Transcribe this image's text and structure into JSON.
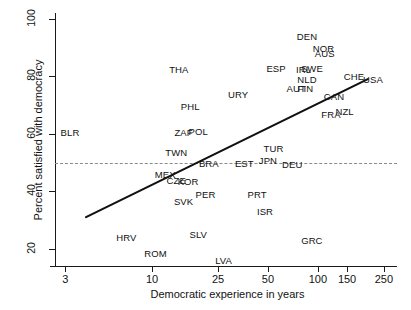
{
  "chart_data": {
    "type": "scatter",
    "title": "",
    "xlabel": "Democratic experience in years",
    "ylabel": "Percent satisfied with democracy",
    "xscale": "log",
    "xlim": [
      2.6,
      300
    ],
    "ylim": [
      14,
      102
    ],
    "xticks": [
      3,
      10,
      25,
      50,
      100,
      150,
      250
    ],
    "xticklabels": [
      "3",
      "10",
      "25",
      "50",
      "100",
      "150",
      "250"
    ],
    "yticks": [
      20,
      40,
      60,
      80,
      100
    ],
    "yticklabels": [
      "20",
      "40",
      "60",
      "80",
      "100"
    ],
    "grid": false,
    "legend": null,
    "reference_line": {
      "y": 50,
      "style": "dashed",
      "color": "#8a8a8a"
    },
    "fit_line": {
      "style": "solid",
      "color": "#111111",
      "width": 2.2,
      "x_start": 4.0,
      "y_start": 31,
      "x_end": 200,
      "y_end": 79
    },
    "points": [
      {
        "label": "BLR",
        "x": 3.2,
        "y": 60.5
      },
      {
        "label": "THA",
        "x": 14.5,
        "y": 82.5
      },
      {
        "label": "PHL",
        "x": 17,
        "y": 69.5
      },
      {
        "label": "ZAF",
        "x": 15.5,
        "y": 60.5
      },
      {
        "label": "POL",
        "x": 19,
        "y": 61
      },
      {
        "label": "TWN",
        "x": 14,
        "y": 53.5
      },
      {
        "label": "MEX",
        "x": 12,
        "y": 46
      },
      {
        "label": "CZE",
        "x": 14,
        "y": 44
      },
      {
        "label": "KOR",
        "x": 16.5,
        "y": 43.5
      },
      {
        "label": "SVK",
        "x": 15.5,
        "y": 36.5
      },
      {
        "label": "HRV",
        "x": 7,
        "y": 24
      },
      {
        "label": "ROM",
        "x": 10.5,
        "y": 18.5
      },
      {
        "label": "SLV",
        "x": 19,
        "y": 25
      },
      {
        "label": "LVA",
        "x": 27,
        "y": 16
      },
      {
        "label": "BRA",
        "x": 22,
        "y": 50
      },
      {
        "label": "PER",
        "x": 21,
        "y": 39
      },
      {
        "label": "URY",
        "x": 33,
        "y": 74
      },
      {
        "label": "EST",
        "x": 36,
        "y": 50
      },
      {
        "label": "PRT",
        "x": 43,
        "y": 39
      },
      {
        "label": "JPN",
        "x": 50,
        "y": 51
      },
      {
        "label": "TUR",
        "x": 54,
        "y": 55
      },
      {
        "label": "ISR",
        "x": 48,
        "y": 33
      },
      {
        "label": "ESP",
        "x": 56,
        "y": 83
      },
      {
        "label": "DEU",
        "x": 70,
        "y": 49.5
      },
      {
        "label": "IRL",
        "x": 82,
        "y": 82.5
      },
      {
        "label": "SWE",
        "x": 92,
        "y": 83
      },
      {
        "label": "NLD",
        "x": 86,
        "y": 79
      },
      {
        "label": "AUT",
        "x": 74,
        "y": 76
      },
      {
        "label": "FIN",
        "x": 84,
        "y": 76
      },
      {
        "label": "DEN",
        "x": 86,
        "y": 94
      },
      {
        "label": "NOR",
        "x": 108,
        "y": 90
      },
      {
        "label": "AUS",
        "x": 110,
        "y": 88
      },
      {
        "label": "GRC",
        "x": 92,
        "y": 23
      },
      {
        "label": "CAN",
        "x": 125,
        "y": 73
      },
      {
        "label": "FRA",
        "x": 120,
        "y": 67
      },
      {
        "label": "NZL",
        "x": 145,
        "y": 68
      },
      {
        "label": "CHE",
        "x": 165,
        "y": 80
      },
      {
        "label": "USA",
        "x": 215,
        "y": 79
      }
    ]
  }
}
